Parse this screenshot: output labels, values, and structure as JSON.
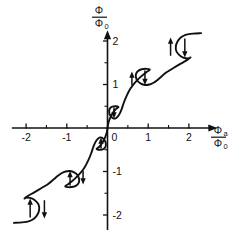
{
  "figure": {
    "title": "",
    "background": "#ffffff",
    "ink_color": "#111111"
  },
  "axes": {
    "x": {
      "label_numerator": "Φ",
      "label_numerator_sub": "a",
      "label_denominator": "Φ",
      "label_denominator_sub": "0",
      "ticks": [
        "-2",
        "-1",
        "0",
        "1",
        "2"
      ],
      "tick_values": [
        -2,
        -1,
        0,
        1,
        2
      ],
      "range": [
        -2.35,
        2.7
      ],
      "minor_ticks": [
        -1.5,
        -0.5,
        0.5,
        1.5,
        2.5
      ]
    },
    "y": {
      "label_numerator": "Φ",
      "label_denominator": "Φ",
      "label_denominator_sub": "0",
      "ticks": [
        "2",
        "1",
        "-1",
        "-2"
      ],
      "tick_values": [
        2,
        1,
        -1,
        -2
      ],
      "range": [
        -2.45,
        2.25
      ],
      "minor_ticks": [
        -1.5,
        -0.5,
        0.5,
        1.5
      ]
    },
    "origin_label": "0"
  },
  "chart_data": {
    "type": "line",
    "title": "",
    "xlabel": "Φa/Φ0",
    "ylabel": "Φ/Φ0",
    "xlim": [
      -2.35,
      2.7
    ],
    "ylim": [
      -2.45,
      2.25
    ],
    "grid": false,
    "legend": null,
    "series": [
      {
        "name": "flux-characteristic",
        "points": [
          [
            -2.3,
            -2.18
          ],
          [
            -2.1,
            -2.17
          ],
          [
            -1.92,
            -2.14
          ],
          [
            -1.8,
            -2.08
          ],
          [
            -1.72,
            -1.99
          ],
          [
            -1.68,
            -1.88
          ],
          [
            -1.69,
            -1.77
          ],
          [
            -1.76,
            -1.68
          ],
          [
            -1.86,
            -1.62
          ],
          [
            -1.98,
            -1.6
          ],
          [
            -2.04,
            -1.62
          ],
          [
            -1.95,
            -1.56
          ],
          [
            -1.8,
            -1.48
          ],
          [
            -1.62,
            -1.38
          ],
          [
            -1.45,
            -1.28
          ],
          [
            -1.32,
            -1.18
          ],
          [
            -1.22,
            -1.1
          ],
          [
            -1.13,
            -1.04
          ],
          [
            -1.03,
            -1.0
          ],
          [
            -0.92,
            -0.99
          ],
          [
            -0.82,
            -1.02
          ],
          [
            -0.74,
            -1.08
          ],
          [
            -0.7,
            -1.16
          ],
          [
            -0.7,
            -1.24
          ],
          [
            -0.75,
            -1.31
          ],
          [
            -0.84,
            -1.35
          ],
          [
            -0.96,
            -1.36
          ],
          [
            -1.04,
            -1.34
          ],
          [
            -0.95,
            -1.28
          ],
          [
            -0.82,
            -1.18
          ],
          [
            -0.68,
            -1.05
          ],
          [
            -0.56,
            -0.9
          ],
          [
            -0.47,
            -0.74
          ],
          [
            -0.4,
            -0.58
          ],
          [
            -0.35,
            -0.44
          ],
          [
            -0.3,
            -0.33
          ],
          [
            -0.25,
            -0.26
          ],
          [
            -0.2,
            -0.22
          ],
          [
            -0.14,
            -0.22
          ],
          [
            -0.09,
            -0.26
          ],
          [
            -0.05,
            -0.32
          ],
          [
            -0.04,
            -0.39
          ],
          [
            -0.06,
            -0.45
          ],
          [
            -0.12,
            -0.49
          ],
          [
            -0.2,
            -0.5
          ],
          [
            -0.27,
            -0.48
          ],
          [
            -0.19,
            -0.42
          ],
          [
            -0.12,
            -0.33
          ],
          [
            -0.06,
            -0.22
          ],
          [
            -0.02,
            -0.11
          ],
          [
            0.0,
            0.0
          ],
          [
            0.02,
            0.11
          ],
          [
            0.06,
            0.22
          ],
          [
            0.12,
            0.33
          ],
          [
            0.19,
            0.42
          ],
          [
            0.27,
            0.48
          ],
          [
            0.2,
            0.5
          ],
          [
            0.12,
            0.49
          ],
          [
            0.06,
            0.45
          ],
          [
            0.04,
            0.39
          ],
          [
            0.05,
            0.32
          ],
          [
            0.09,
            0.26
          ],
          [
            0.14,
            0.22
          ],
          [
            0.2,
            0.22
          ],
          [
            0.25,
            0.26
          ],
          [
            0.3,
            0.33
          ],
          [
            0.35,
            0.44
          ],
          [
            0.4,
            0.58
          ],
          [
            0.47,
            0.74
          ],
          [
            0.56,
            0.9
          ],
          [
            0.68,
            1.05
          ],
          [
            0.82,
            1.18
          ],
          [
            0.95,
            1.28
          ],
          [
            1.04,
            1.34
          ],
          [
            0.96,
            1.36
          ],
          [
            0.84,
            1.35
          ],
          [
            0.75,
            1.31
          ],
          [
            0.7,
            1.24
          ],
          [
            0.7,
            1.16
          ],
          [
            0.74,
            1.08
          ],
          [
            0.82,
            1.02
          ],
          [
            0.92,
            0.99
          ],
          [
            1.03,
            1.0
          ],
          [
            1.13,
            1.04
          ],
          [
            1.22,
            1.1
          ],
          [
            1.32,
            1.18
          ],
          [
            1.45,
            1.28
          ],
          [
            1.62,
            1.38
          ],
          [
            1.8,
            1.48
          ],
          [
            1.95,
            1.56
          ],
          [
            2.04,
            1.62
          ],
          [
            1.98,
            1.6
          ],
          [
            1.86,
            1.62
          ],
          [
            1.76,
            1.68
          ],
          [
            1.69,
            1.77
          ],
          [
            1.68,
            1.88
          ],
          [
            1.72,
            1.99
          ],
          [
            1.8,
            2.08
          ],
          [
            1.92,
            2.14
          ],
          [
            2.1,
            2.17
          ],
          [
            2.3,
            2.18
          ]
        ]
      }
    ],
    "annotations": [
      {
        "name": "jump-arrow-up-1",
        "x": -1.9,
        "y_from": -2.06,
        "y_to": -1.62,
        "direction": "up"
      },
      {
        "name": "jump-arrow-down-1",
        "x": -1.55,
        "y_from": -1.66,
        "y_to": -2.08,
        "direction": "down"
      },
      {
        "name": "jump-arrow-up-2",
        "x": -0.92,
        "y_from": -1.32,
        "y_to": -0.99,
        "direction": "up"
      },
      {
        "name": "jump-arrow-down-2",
        "x": -0.6,
        "y_from": -0.98,
        "y_to": -1.3,
        "direction": "down"
      },
      {
        "name": "jump-arrow-up-3",
        "x": -0.16,
        "y_from": -0.47,
        "y_to": -0.22,
        "direction": "up"
      },
      {
        "name": "jump-arrow-down-3",
        "x": 0.16,
        "y_from": 0.47,
        "y_to": 0.22,
        "direction": "down"
      },
      {
        "name": "jump-arrow-up-4",
        "x": 0.6,
        "y_from": 0.98,
        "y_to": 1.3,
        "direction": "up"
      },
      {
        "name": "jump-arrow-down-4",
        "x": 0.92,
        "y_from": 1.32,
        "y_to": 0.99,
        "direction": "down"
      },
      {
        "name": "jump-arrow-up-5",
        "x": 1.55,
        "y_from": 1.66,
        "y_to": 2.08,
        "direction": "up"
      },
      {
        "name": "jump-arrow-down-5",
        "x": 1.9,
        "y_from": 2.06,
        "y_to": 1.62,
        "direction": "down"
      }
    ]
  }
}
